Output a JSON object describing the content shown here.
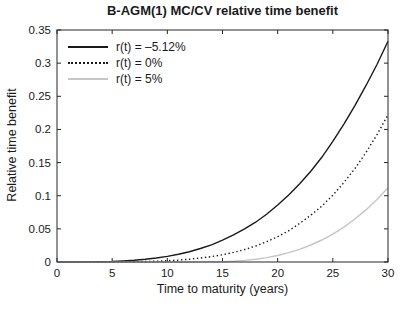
{
  "chart_data": {
    "type": "line",
    "title": "B-AGM(1) MC/CV relative time benefit",
    "xlabel": "Time to maturity (years)",
    "ylabel": "Relative time benefit",
    "xlim": [
      0,
      30
    ],
    "ylim": [
      0,
      0.35
    ],
    "xticks": [
      0,
      5,
      10,
      15,
      20,
      25,
      30
    ],
    "xtick_labels": [
      "0",
      "5",
      "10",
      "15",
      "20",
      "25",
      "30"
    ],
    "yticks": [
      0,
      0.05,
      0.1,
      0.15,
      0.2,
      0.25,
      0.3,
      0.35
    ],
    "ytick_labels": [
      "0",
      "0.05",
      "0.1",
      "0.15",
      "0.2",
      "0.25",
      "0.3",
      "0.35"
    ],
    "grid": false,
    "legend_position": "upper-left-inside",
    "axis_color": "#262626",
    "x": [
      0,
      1,
      2,
      3,
      4,
      5,
      6,
      7,
      8,
      9,
      10,
      11,
      12,
      13,
      14,
      15,
      16,
      17,
      18,
      19,
      20,
      21,
      22,
      23,
      24,
      25,
      26,
      27,
      28,
      29,
      30
    ],
    "series": [
      {
        "name": "r(t) = –5.12%",
        "color": "#1a1a1a",
        "style": "solid",
        "values": [
          0,
          0.0,
          0.0001,
          0.0002,
          0.0004,
          0.0008,
          0.0015,
          0.0026,
          0.004,
          0.006,
          0.0085,
          0.0116,
          0.0156,
          0.0203,
          0.026,
          0.033,
          0.041,
          0.05,
          0.06,
          0.072,
          0.086,
          0.101,
          0.118,
          0.137,
          0.158,
          0.182,
          0.208,
          0.236,
          0.266,
          0.298,
          0.333
        ]
      },
      {
        "name": "r(t) = 0%",
        "color": "#1a1a1a",
        "style": "dotted",
        "values": [
          0,
          0,
          0,
          0,
          0.0,
          0.0001,
          0.0002,
          0.0004,
          0.0007,
          0.0012,
          0.0019,
          0.0029,
          0.0042,
          0.006,
          0.0081,
          0.0109,
          0.0145,
          0.0188,
          0.0242,
          0.0307,
          0.0382,
          0.0472,
          0.0582,
          0.0706,
          0.0843,
          0.1008,
          0.1199,
          0.1409,
          0.165,
          0.192,
          0.222
        ]
      },
      {
        "name": "r(t) = 5%",
        "color": "#c5c5c5",
        "style": "solid",
        "values": [
          0,
          0,
          0,
          0,
          0,
          0,
          0,
          0,
          0,
          0,
          0,
          0,
          0,
          0.0001,
          0.0002,
          0.0005,
          0.0012,
          0.0024,
          0.0041,
          0.0066,
          0.0098,
          0.014,
          0.0192,
          0.0256,
          0.0332,
          0.0421,
          0.0527,
          0.0648,
          0.0786,
          0.0943,
          0.112
        ]
      }
    ]
  }
}
